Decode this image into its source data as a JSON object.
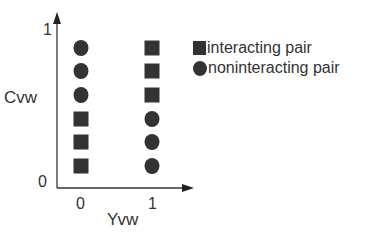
{
  "axes": {
    "y_label": "Cvw",
    "x_label": "Yvw",
    "y_ticks": [
      "0",
      "1"
    ],
    "x_ticks": [
      "0",
      "1"
    ]
  },
  "legend": {
    "items": [
      {
        "marker": "square",
        "label": "interacting pair"
      },
      {
        "marker": "circle",
        "label": "noninteracting pair"
      }
    ]
  },
  "colors": {
    "marker": "#333333",
    "axis": "#333333"
  },
  "chart_data": {
    "type": "scatter",
    "xlabel": "Yvw",
    "ylabel": "Cvw",
    "x_ticks": [
      0,
      1
    ],
    "y_ticks": [
      0,
      1
    ],
    "ylim": [
      0,
      1
    ],
    "series": [
      {
        "name": "interacting pair",
        "marker": "square",
        "points": [
          [
            0,
            0.1
          ],
          [
            0,
            0.23
          ],
          [
            0,
            0.36
          ],
          [
            1,
            0.49
          ],
          [
            1,
            0.62
          ],
          [
            1,
            0.75
          ]
        ]
      },
      {
        "name": "noninteracting pair",
        "marker": "circle",
        "points": [
          [
            0,
            0.49
          ],
          [
            0,
            0.62
          ],
          [
            0,
            0.75
          ],
          [
            1,
            0.1
          ],
          [
            1,
            0.23
          ],
          [
            1,
            0.36
          ]
        ]
      }
    ],
    "columns": [
      {
        "x": 0,
        "markers_top_to_bottom": [
          "circle",
          "circle",
          "circle",
          "square",
          "square",
          "square"
        ]
      },
      {
        "x": 1,
        "markers_top_to_bottom": [
          "square",
          "square",
          "square",
          "circle",
          "circle",
          "circle"
        ]
      }
    ]
  }
}
